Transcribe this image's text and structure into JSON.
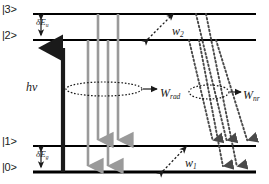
{
  "figure": {
    "kind": "energy-level-diagram",
    "width": 269,
    "height": 184,
    "background": "#ffffff"
  },
  "colors": {
    "level_line": "#000000",
    "pump_arrow": "#1a1a1a",
    "radiative_arrow": "#9a9a9a",
    "nonradiative_arrow": "#4a4a4a",
    "text": "#1a1a1a"
  },
  "states": [
    {
      "id": "state-3",
      "label": "|3>",
      "y": 14,
      "label_x": 2,
      "label_y": 3,
      "x1": 33,
      "x2": 256,
      "thickness": 2.2
    },
    {
      "id": "state-2",
      "label": "|2>",
      "y": 40,
      "label_x": 2,
      "label_y": 29,
      "x1": 33,
      "x2": 256,
      "thickness": 2.2
    },
    {
      "id": "state-1",
      "label": "|1>",
      "y": 146,
      "label_x": 2,
      "label_y": 135,
      "x1": 33,
      "x2": 256,
      "thickness": 2.2
    },
    {
      "id": "state-0",
      "label": "|0>",
      "y": 172,
      "label_x": 2,
      "label_y": 161,
      "x1": 33,
      "x2": 256,
      "thickness": 3.0
    }
  ],
  "labels": {
    "delta_e_upper": {
      "base": "δE",
      "sub": "u",
      "x": 36,
      "y": 17
    },
    "delta_e_ground": {
      "base": "δE",
      "sub": "g",
      "x": 36,
      "y": 149
    },
    "pump_photon": {
      "text": "hν",
      "x": 26,
      "y": 80
    },
    "w_two": {
      "base": "w",
      "sub": "2",
      "x": 172,
      "y": 24
    },
    "w_one": {
      "base": "w",
      "sub": "1",
      "x": 185,
      "y": 156
    },
    "w_rad": {
      "base": "W",
      "sub": "rad",
      "x": 160,
      "y": 86
    },
    "w_nr": {
      "base": "W",
      "sub": "nr",
      "x": 243,
      "y": 88
    }
  },
  "arrows": {
    "pump": {
      "x": 63,
      "y_from": 172,
      "y_to": 41,
      "width": 4.2,
      "direction": "up"
    },
    "radiative": [
      {
        "x": 88,
        "y_from": 40,
        "y_to": 172
      },
      {
        "x": 98,
        "y_from": 14,
        "y_to": 146
      },
      {
        "x": 108,
        "y_from": 40,
        "y_to": 172
      },
      {
        "x": 118,
        "y_from": 14,
        "y_to": 146
      }
    ],
    "nonradiative": [
      {
        "x_from": 196,
        "y_from": 14,
        "x_to": 228,
        "y_to": 146
      },
      {
        "x_from": 206,
        "y_from": 14,
        "x_to": 238,
        "y_to": 172
      },
      {
        "x_from": 189,
        "y_from": 40,
        "x_to": 214,
        "y_to": 146
      },
      {
        "x_from": 199,
        "y_from": 40,
        "x_to": 224,
        "y_to": 172
      },
      {
        "x_from": 216,
        "y_from": 40,
        "x_to": 249,
        "y_to": 146
      }
    ],
    "w2_double": {
      "x1": 148,
      "y1": 39,
      "x2": 173,
      "y2": 14
    },
    "w1_double": {
      "x1": 163,
      "y1": 171,
      "x2": 186,
      "y2": 147
    }
  },
  "annotations": {
    "rad_ellipse": {
      "cx": 104,
      "cy": 89,
      "rx": 38,
      "ry": 7
    },
    "rad_pointer": {
      "x1": 143,
      "y1": 89,
      "x2": 157,
      "y2": 89
    },
    "nr_ellipse": {
      "cx": 209,
      "cy": 92,
      "rx": 20,
      "ry": 7
    },
    "nr_pointer": {
      "x1": 230,
      "y1": 92,
      "x2": 241,
      "y2": 92
    }
  },
  "brackets": {
    "upper_gap": {
      "x": 41,
      "y_top": 15,
      "y_bottom": 39
    },
    "ground_gap": {
      "x": 41,
      "y_top": 147,
      "y_bottom": 171
    }
  }
}
